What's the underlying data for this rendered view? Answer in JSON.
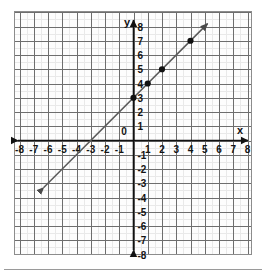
{
  "figure": {
    "name": "coordinate-plane-graph",
    "background_color": "#ffffff",
    "plot_area_background": "#fdfdfd",
    "grid_minor_color": "#e6e6e6",
    "grid_major_color": "#6e6e6e",
    "axis_color": "#111111",
    "line_color": "#555555",
    "point_color": "#111111",
    "frame_color": "#8c8c8c",
    "footer_rule_color": "#9a9a9a"
  },
  "axes": {
    "x_label": "x",
    "y_label": "y",
    "origin_label": "0",
    "x_min": -8,
    "x_max": 8,
    "y_min": -8,
    "y_max": 8,
    "x_ticks": [
      {
        "value": -8,
        "label": "-8"
      },
      {
        "value": -7,
        "label": "-7"
      },
      {
        "value": -6,
        "label": "-6"
      },
      {
        "value": -5,
        "label": "-5"
      },
      {
        "value": -4,
        "label": "-4"
      },
      {
        "value": -3,
        "label": "-3"
      },
      {
        "value": -2,
        "label": "-2"
      },
      {
        "value": -1,
        "label": "-1"
      },
      {
        "value": 1,
        "label": "1"
      },
      {
        "value": 2,
        "label": "2"
      },
      {
        "value": 3,
        "label": "3"
      },
      {
        "value": 4,
        "label": "4"
      },
      {
        "value": 5,
        "label": "5"
      },
      {
        "value": 6,
        "label": "6"
      },
      {
        "value": 7,
        "label": "7"
      },
      {
        "value": 8,
        "label": "8"
      }
    ],
    "y_ticks": [
      {
        "value": 8,
        "label": "8"
      },
      {
        "value": 7,
        "label": "7"
      },
      {
        "value": 6,
        "label": "6"
      },
      {
        "value": 5,
        "label": "5"
      },
      {
        "value": 4,
        "label": "4"
      },
      {
        "value": 3,
        "label": "3"
      },
      {
        "value": 2,
        "label": "2"
      },
      {
        "value": 1,
        "label": "1"
      },
      {
        "value": -1,
        "label": "-1"
      },
      {
        "value": -2,
        "label": "-2"
      },
      {
        "value": -3,
        "label": "-3"
      },
      {
        "value": -4,
        "label": "-4"
      },
      {
        "value": -5,
        "label": "-5"
      },
      {
        "value": -6,
        "label": "-6"
      },
      {
        "value": -7,
        "label": "-7"
      },
      {
        "value": -8,
        "label": "-8"
      }
    ]
  },
  "chart_data": {
    "type": "line",
    "title": "",
    "subtitle": "",
    "xlabel": "x",
    "ylabel": "y",
    "xlim": [
      -8.5,
      8.5
    ],
    "ylim": [
      -8.5,
      8.5
    ],
    "grid": true,
    "grid_spacing": 1,
    "minor_grid_spacing": 0.5,
    "legend": "none",
    "series": [
      {
        "name": "line",
        "equation": "y = x + 3",
        "slope": 1,
        "intercept": 3,
        "arrow_start": true,
        "arrow_end": true,
        "x_start": -6.3,
        "x_end": 5.2,
        "marked_points": [
          {
            "x": 0,
            "y": 3
          },
          {
            "x": 1,
            "y": 4
          },
          {
            "x": 2,
            "y": 5
          },
          {
            "x": 4,
            "y": 7
          }
        ]
      }
    ]
  }
}
